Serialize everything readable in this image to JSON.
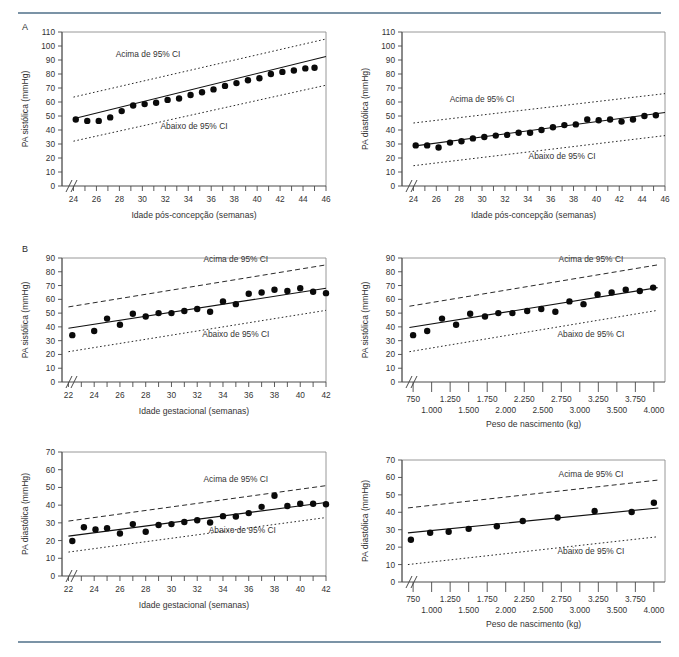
{
  "figure": {
    "panel_a_label": "A",
    "panel_b_label": "B",
    "ci_above_label": "Acima de 95% CI",
    "ci_below_label": "Abaixo de 95% CI",
    "rule_color": "#7b93a6",
    "point_color": "#0a0a0a",
    "line_color": "#111111"
  },
  "chart_data": [
    {
      "id": "a-systolic-postconception",
      "panel": "A",
      "type": "scatter",
      "title": "",
      "xlabel": "Idade pós-concepção (semanas)",
      "ylabel": "PA sistólica (mmHg)",
      "xlim": [
        23,
        46
      ],
      "ylim": [
        0,
        110
      ],
      "xticks": [
        24,
        25,
        26,
        27,
        28,
        29,
        30,
        31,
        32,
        33,
        34,
        35,
        36,
        37,
        38,
        39,
        40,
        41,
        42,
        43,
        44,
        45,
        46
      ],
      "xticklabels": [
        "24",
        "",
        "26",
        "",
        "28",
        "",
        "30",
        "",
        "32",
        "",
        "34",
        "",
        "36",
        "",
        "38",
        "",
        "40",
        "",
        "42",
        "",
        "44",
        "",
        "46"
      ],
      "yticks": [
        0,
        10,
        20,
        30,
        40,
        50,
        60,
        70,
        80,
        90,
        100,
        110
      ],
      "yticklabels": [
        "0",
        "10",
        "20",
        "30",
        "40",
        "50",
        "60",
        "70",
        "80",
        "90",
        "100",
        "110"
      ],
      "axis_break_x": true,
      "grid": false,
      "legend": "none",
      "annotations": [
        {
          "text": "Acima de 95% CI",
          "x": 30.5,
          "y": 92
        },
        {
          "text": "Abaixo de 95% CI",
          "x": 34.5,
          "y": 41
        }
      ],
      "series": [
        {
          "name": "PA sistólica média",
          "marker": "filled-circle",
          "x": [
            24.2,
            25.2,
            26.2,
            27.2,
            28.2,
            29.2,
            30.2,
            31.2,
            32.2,
            33.2,
            34.2,
            35.2,
            36.2,
            37.2,
            38.2,
            39.2,
            40.2,
            41.2,
            42.2,
            43.2,
            44.2,
            45.0
          ],
          "y": [
            47.5,
            46.5,
            46.5,
            49.0,
            53.5,
            57.5,
            58.5,
            59.5,
            61.5,
            62.5,
            65.0,
            67.0,
            69.0,
            71.5,
            73.5,
            75.5,
            77.0,
            80.0,
            81.5,
            82.5,
            84.0,
            84.5
          ]
        },
        {
          "name": "Linha de regressão",
          "type": "line",
          "x": [
            24,
            46
          ],
          "y": [
            48.0,
            92.5
          ]
        },
        {
          "name": "Acima de 95% CI",
          "type": "line",
          "style": "dotted",
          "x": [
            24,
            46
          ],
          "y": [
            63.5,
            105.0
          ]
        },
        {
          "name": "Abaixo de 95% CI",
          "type": "line",
          "style": "dotted",
          "x": [
            24,
            46
          ],
          "y": [
            32.0,
            72.0
          ]
        }
      ]
    },
    {
      "id": "a-diastolic-postconception",
      "panel": "A",
      "type": "scatter",
      "title": "",
      "xlabel": "Idade pós-concepção (semanas)",
      "ylabel": "PA diastólica (mmHg)",
      "xlim": [
        23,
        46
      ],
      "ylim": [
        0,
        110
      ],
      "xticks": [
        24,
        25,
        26,
        27,
        28,
        29,
        30,
        31,
        32,
        33,
        34,
        35,
        36,
        37,
        38,
        39,
        40,
        41,
        42,
        43,
        44,
        45,
        46
      ],
      "xticklabels": [
        "24",
        "",
        "26",
        "",
        "28",
        "",
        "30",
        "",
        "32",
        "",
        "34",
        "",
        "36",
        "",
        "38",
        "",
        "40",
        "",
        "42",
        "",
        "44",
        "",
        "46"
      ],
      "yticks": [
        0,
        10,
        20,
        30,
        40,
        50,
        60,
        70,
        80,
        90,
        100,
        110
      ],
      "yticklabels": [
        "0",
        "10",
        "20",
        "30",
        "40",
        "50",
        "60",
        "70",
        "80",
        "90",
        "100",
        "110"
      ],
      "axis_break_x": true,
      "grid": false,
      "legend": "none",
      "annotations": [
        {
          "text": "Acima de 95% CI",
          "x": 30.0,
          "y": 60
        },
        {
          "text": "Abaixo de 95% CI",
          "x": 37.0,
          "y": 19
        }
      ],
      "series": [
        {
          "name": "PA diastólica média",
          "marker": "filled-circle",
          "x": [
            24.2,
            25.2,
            26.2,
            27.2,
            28.2,
            29.2,
            30.2,
            31.2,
            32.2,
            33.2,
            34.2,
            35.2,
            36.2,
            37.2,
            38.2,
            39.2,
            40.2,
            41.2,
            42.2,
            43.2,
            44.2,
            45.2
          ],
          "y": [
            29.0,
            29.0,
            27.5,
            31.0,
            32.0,
            34.0,
            35.0,
            36.0,
            36.5,
            38.0,
            38.0,
            40.0,
            42.0,
            43.5,
            44.0,
            47.5,
            47.0,
            47.5,
            46.0,
            47.5,
            50.0,
            50.5
          ]
        },
        {
          "name": "Linha de regressão",
          "type": "line",
          "x": [
            24,
            46
          ],
          "y": [
            28.5,
            52.5
          ]
        },
        {
          "name": "Acima de 95% CI",
          "type": "line",
          "style": "dotted",
          "x": [
            24,
            46
          ],
          "y": [
            45.0,
            66.0
          ]
        },
        {
          "name": "Abaixo de 95% CI",
          "type": "line",
          "style": "dotted",
          "x": [
            24,
            46
          ],
          "y": [
            14.5,
            36.0
          ]
        }
      ]
    },
    {
      "id": "b-systolic-gestational",
      "panel": "B",
      "type": "scatter",
      "title": "",
      "xlabel": "Idade gestacional (semanas)",
      "ylabel": "PA sistólica (mmHg)",
      "xlim": [
        21.5,
        42
      ],
      "ylim": [
        0,
        90
      ],
      "xticks": [
        22,
        23,
        24,
        25,
        26,
        27,
        28,
        29,
        30,
        31,
        32,
        33,
        34,
        35,
        36,
        37,
        38,
        39,
        40,
        41,
        42
      ],
      "xticklabels": [
        "22",
        "",
        "24",
        "",
        "26",
        "",
        "28",
        "",
        "30",
        "",
        "32",
        "",
        "34",
        "",
        "36",
        "",
        "38",
        "",
        "40",
        "",
        "42"
      ],
      "yticks": [
        0,
        10,
        20,
        30,
        40,
        50,
        60,
        70,
        80,
        90
      ],
      "yticklabels": [
        "0",
        "10",
        "20",
        "30",
        "40",
        "50",
        "60",
        "70",
        "80",
        "90"
      ],
      "axis_break_x": true,
      "grid": false,
      "legend": "none",
      "annotations": [
        {
          "text": "Acima de 95% CI",
          "x": 35.0,
          "y": 87
        },
        {
          "text": "Abaixo de 95% CI",
          "x": 35.0,
          "y": 33
        }
      ],
      "series": [
        {
          "name": "PA sistólica média",
          "marker": "filled-circle",
          "x": [
            22.3,
            24.0,
            25.0,
            26.0,
            27.0,
            28.0,
            29.0,
            30.0,
            31.0,
            32.0,
            33.0,
            34.0,
            35.0,
            36.0,
            37.0,
            38.0,
            39.0,
            40.0,
            41.0,
            42.0
          ],
          "y": [
            34.0,
            37.0,
            46.0,
            41.5,
            49.5,
            47.5,
            50.0,
            50.0,
            51.5,
            53.0,
            51.0,
            58.5,
            56.5,
            64.0,
            65.0,
            67.0,
            66.0,
            68.0,
            65.5,
            64.5
          ]
        },
        {
          "name": "Linha de regressão",
          "type": "line",
          "x": [
            22,
            42
          ],
          "y": [
            39.0,
            68.0
          ]
        },
        {
          "name": "Acima de 95% CI",
          "type": "line",
          "style": "dashed",
          "x": [
            22,
            42
          ],
          "y": [
            54.5,
            85.0
          ]
        },
        {
          "name": "Abaixo de 95% CI",
          "type": "line",
          "style": "dotted",
          "x": [
            22,
            42
          ],
          "y": [
            22.0,
            52.0
          ]
        }
      ]
    },
    {
      "id": "b-systolic-birthweight",
      "panel": "B",
      "type": "scatter",
      "title": "",
      "xlabel": "Peso de nascimento (kg)",
      "ylabel": "PA sistólica (mmHg)",
      "xlim": [
        600,
        4150
      ],
      "ylim": [
        0,
        90
      ],
      "xticks": [
        750,
        1000,
        1250,
        1500,
        1750,
        2000,
        2250,
        2500,
        2750,
        3000,
        3250,
        3500,
        3750,
        4000
      ],
      "xticklabels_upper": [
        "750",
        "1.250",
        "1.750",
        "2.250",
        "2.750",
        "3.250",
        "3.750"
      ],
      "xticklabels_lower": [
        "1.000",
        "1.500",
        "2.000",
        "2.500",
        "3.000",
        "3.500",
        "4.000"
      ],
      "yticks": [
        0,
        10,
        20,
        30,
        40,
        50,
        60,
        70,
        80,
        90
      ],
      "yticklabels": [
        "0",
        "10",
        "20",
        "30",
        "40",
        "50",
        "60",
        "70",
        "80",
        "90"
      ],
      "axis_break_x": true,
      "grid": false,
      "legend": "none",
      "annotations": [
        {
          "text": "Acima de 95% CI",
          "x": 3150,
          "y": 87
        },
        {
          "text": "Abaixo de 95% CI",
          "x": 3150,
          "y": 33
        }
      ],
      "series": [
        {
          "name": "PA sistólica média",
          "marker": "filled-circle",
          "x": [
            750,
            940,
            1140,
            1330,
            1520,
            1720,
            1900,
            2090,
            2290,
            2480,
            2670,
            2860,
            3050,
            3240,
            3430,
            3620,
            3810,
            3990
          ],
          "y": [
            34.0,
            37.0,
            46.0,
            41.5,
            49.5,
            47.5,
            50.0,
            50.0,
            51.5,
            53.0,
            51.0,
            58.5,
            56.5,
            63.5,
            65.0,
            67.0,
            66.0,
            68.5
          ]
        },
        {
          "name": "Linha de regressão",
          "type": "line",
          "x": [
            700,
            4050
          ],
          "y": [
            39.5,
            68.5
          ]
        },
        {
          "name": "Acima de 95% CI",
          "type": "line",
          "style": "dashed",
          "x": [
            700,
            4050
          ],
          "y": [
            55.0,
            85.0
          ]
        },
        {
          "name": "Abaixo de 95% CI",
          "type": "line",
          "style": "dotted",
          "x": [
            700,
            4050
          ],
          "y": [
            22.0,
            52.0
          ]
        }
      ]
    },
    {
      "id": "b-diastolic-gestational",
      "panel": "B",
      "type": "scatter",
      "title": "",
      "xlabel": "Idade gestacional (semanas)",
      "ylabel": "PA diastólica (mmHg)",
      "xlim": [
        21.5,
        42
      ],
      "ylim": [
        0,
        70
      ],
      "xticks": [
        22,
        23,
        24,
        25,
        26,
        27,
        28,
        29,
        30,
        31,
        32,
        33,
        34,
        35,
        36,
        37,
        38,
        39,
        40,
        41,
        42
      ],
      "xticklabels": [
        "22",
        "",
        "24",
        "",
        "26",
        "",
        "28",
        "",
        "30",
        "",
        "32",
        "",
        "34",
        "",
        "36",
        "",
        "38",
        "",
        "40",
        "",
        "42"
      ],
      "yticks": [
        0,
        10,
        20,
        30,
        40,
        50,
        60,
        70
      ],
      "yticklabels": [
        "0",
        "10",
        "20",
        "30",
        "40",
        "50",
        "60",
        "70"
      ],
      "axis_break_x": true,
      "grid": false,
      "legend": "none",
      "annotations": [
        {
          "text": "Acima de 95% CI",
          "x": 35.0,
          "y": 53
        },
        {
          "text": "Abaixo de 95% CI",
          "x": 35.5,
          "y": 24
        }
      ],
      "series": [
        {
          "name": "PA diastólica média",
          "marker": "filled-circle",
          "x": [
            22.3,
            23.2,
            24.1,
            25.0,
            26.0,
            27.0,
            28.0,
            29.0,
            30.0,
            31.0,
            32.0,
            33.0,
            34.0,
            35.0,
            36.0,
            37.0,
            38.0,
            39.0,
            40.0,
            41.0,
            42.0
          ],
          "y": [
            19.8,
            27.5,
            26.3,
            27.0,
            24.0,
            29.3,
            25.0,
            28.8,
            29.3,
            30.5,
            31.5,
            30.2,
            33.8,
            33.6,
            35.5,
            39.0,
            45.3,
            39.5,
            40.8,
            40.8,
            40.5
          ]
        },
        {
          "name": "Linha de regressão",
          "type": "line",
          "x": [
            22,
            42
          ],
          "y": [
            22.5,
            41.5
          ]
        },
        {
          "name": "Acima de 95% CI",
          "type": "line",
          "style": "dashed",
          "x": [
            22,
            42
          ],
          "y": [
            31.0,
            51.0
          ]
        },
        {
          "name": "Abaixo de 95% CI",
          "type": "line",
          "style": "dotted",
          "x": [
            22,
            42
          ],
          "y": [
            13.5,
            33.0
          ]
        }
      ]
    },
    {
      "id": "b-diastolic-birthweight",
      "panel": "B",
      "type": "scatter",
      "title": "",
      "xlabel": "Peso de nascimento (kg)",
      "ylabel": "PA diastólica (mmHg)",
      "xlim": [
        600,
        4150
      ],
      "ylim": [
        0,
        70
      ],
      "xticks": [
        750,
        1000,
        1250,
        1500,
        1750,
        2000,
        2250,
        2500,
        2750,
        3000,
        3250,
        3500,
        3750,
        4000
      ],
      "xticklabels_upper": [
        "750",
        "1.250",
        "1.750",
        "2.250",
        "2.750",
        "3.250",
        "3.750"
      ],
      "xticklabels_lower": [
        "1.000",
        "1.500",
        "2.000",
        "2.500",
        "3.000",
        "3.500",
        "4.000"
      ],
      "yticks": [
        0,
        10,
        20,
        30,
        40,
        50,
        60,
        70
      ],
      "yticklabels": [
        "0",
        "10",
        "20",
        "30",
        "40",
        "50",
        "60",
        "70"
      ],
      "axis_break_x": true,
      "grid": false,
      "legend": "none",
      "annotations": [
        {
          "text": "Acima de 95% CI",
          "x": 3150,
          "y": 60
        },
        {
          "text": "Abaixo de 95% CI",
          "x": 3150,
          "y": 16
        }
      ],
      "series": [
        {
          "name": "PA diastólica média",
          "marker": "filled-circle",
          "x": [
            720,
            980,
            1230,
            1500,
            1880,
            2230,
            2700,
            3200,
            3700,
            4000
          ],
          "y": [
            24.2,
            28.3,
            28.8,
            30.5,
            32.0,
            35.0,
            37.0,
            40.7,
            40.2,
            45.5
          ]
        },
        {
          "name": "Linha de regressão",
          "type": "line",
          "x": [
            680,
            4060
          ],
          "y": [
            28.2,
            42.5
          ]
        },
        {
          "name": "Acima de 95% CI",
          "type": "line",
          "style": "dashed",
          "x": [
            680,
            4060
          ],
          "y": [
            42.5,
            58.5
          ]
        },
        {
          "name": "Abaixo de 95% CI",
          "type": "line",
          "style": "dotted",
          "x": [
            680,
            4060
          ],
          "y": [
            10.0,
            26.0
          ]
        }
      ]
    }
  ]
}
